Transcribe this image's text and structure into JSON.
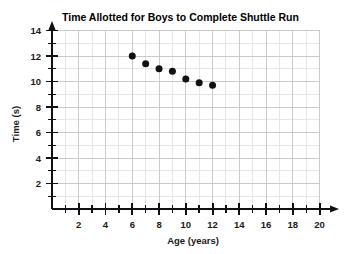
{
  "chart_data": {
    "type": "scatter",
    "title": "Time Allotted for Boys to Complete Shuttle Run",
    "xlabel": "Age (years)",
    "ylabel": "Time (s)",
    "xlim": [
      0,
      21
    ],
    "ylim": [
      0,
      15
    ],
    "xticks": [
      2,
      4,
      6,
      8,
      10,
      12,
      14,
      16,
      18,
      20
    ],
    "yticks": [
      2,
      4,
      6,
      8,
      10,
      12,
      14
    ],
    "x_minor_step": 1,
    "y_minor_step": 1,
    "grid": true,
    "legend": "none",
    "x": [
      6,
      7,
      8,
      9,
      10,
      11,
      12
    ],
    "values": [
      12.0,
      11.4,
      11.0,
      10.8,
      10.2,
      9.9,
      9.7
    ],
    "points": [
      {
        "x": 6,
        "y": 12.0
      },
      {
        "x": 7,
        "y": 11.4
      },
      {
        "x": 8,
        "y": 11.0
      },
      {
        "x": 9,
        "y": 10.8
      },
      {
        "x": 10,
        "y": 10.2
      },
      {
        "x": 11,
        "y": 9.9
      },
      {
        "x": 12,
        "y": 9.7
      }
    ],
    "marker": "filled-circle",
    "marker_color": "#111111",
    "grid_color": "#c9c9cf",
    "axis_color": "#111111",
    "background": "#ffffff"
  }
}
